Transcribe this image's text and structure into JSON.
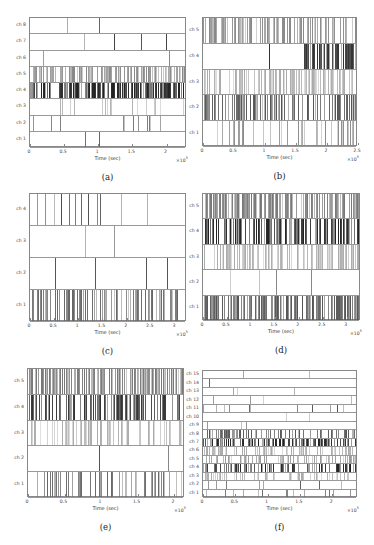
{
  "figure": {
    "xlabel": "Time (sec)",
    "multiplier": "×10",
    "exponent": "5"
  },
  "chart_data": [
    {
      "id": "a",
      "caption": "(a)",
      "type": "raster",
      "xlabel": "Time (sec)",
      "x_multiplier": "x10^5",
      "xlim": [
        0,
        2.3
      ],
      "xticks": [
        "0",
        "0.5",
        "1",
        "1.5",
        "2"
      ],
      "xtick_values": [
        0,
        0.5,
        1,
        1.5,
        2
      ],
      "channels": [
        "ch 1",
        "ch 2",
        "ch 3",
        "ch 4",
        "ch 5",
        "ch 6",
        "ch 7",
        "ch 8"
      ],
      "box": {
        "left": 29,
        "top": 17,
        "width": 157,
        "height": 130
      },
      "density": [
        1,
        12,
        18,
        160,
        130,
        1,
        2,
        1
      ],
      "shade": [
        "#666",
        "#777",
        "#aaa",
        "#222",
        "#888",
        "#888",
        "#444",
        "#666"
      ],
      "spikes_fixed": {
        "ch 8": [
          1.03
        ],
        "ch 7": [
          1.24,
          2.02
        ],
        "ch 1": [
          1.03
        ],
        "ch 6": [
          2.06
        ]
      },
      "seed": 11
    },
    {
      "id": "b",
      "caption": "(b)",
      "type": "raster",
      "xlabel": "Time (sec)",
      "x_multiplier": "x10^5",
      "xlim": [
        0,
        2.5
      ],
      "xticks": [
        "0",
        "0.5",
        "1",
        "1.5",
        "2",
        "2.5"
      ],
      "xtick_values": [
        0,
        0.5,
        1,
        1.5,
        2,
        2.5
      ],
      "channels": [
        "ch 1",
        "ch 2",
        "ch 3",
        "ch 4",
        "ch 5"
      ],
      "box": {
        "left": 202,
        "top": 17,
        "width": 155,
        "height": 129
      },
      "density": [
        40,
        110,
        120,
        70,
        110
      ],
      "shade": [
        "#888",
        "#555",
        "#aaa",
        "#333",
        "#888"
      ],
      "ch4_start": 1.65,
      "spikes_fixed": {
        "ch 4": [
          1.08
        ]
      },
      "seed": 23
    },
    {
      "id": "c",
      "caption": "(c)",
      "type": "raster",
      "xlabel": "Time (sec)",
      "x_multiplier": "x10^5",
      "xlim": [
        0,
        3.25
      ],
      "xticks": [
        "0",
        "0.5",
        "1",
        "1.5",
        "2",
        "2.5",
        "3"
      ],
      "xtick_values": [
        0,
        0.5,
        1,
        1.5,
        2,
        2.5,
        3
      ],
      "channels": [
        "ch 1",
        "ch 2",
        "ch 3",
        "ch 4"
      ],
      "box": {
        "left": 29,
        "top": 193,
        "width": 157,
        "height": 128
      },
      "density": [
        90,
        2,
        1,
        12
      ],
      "shade": [
        "#666",
        "#555",
        "#999",
        "#444"
      ],
      "spikes_fixed": {
        "ch 3": [
          1.77
        ],
        "ch 2": [
          2.44,
          2.87
        ]
      },
      "seed": 37
    },
    {
      "id": "d",
      "caption": "(d)",
      "type": "raster",
      "xlabel": "Time (sec)",
      "x_multiplier": "x10^5",
      "xlim": [
        0,
        3.3
      ],
      "xticks": [
        "0",
        "0.5",
        "1",
        "1.5",
        "2",
        "2.5",
        "3"
      ],
      "xtick_values": [
        0,
        0.5,
        1,
        1.5,
        2,
        2.5,
        3
      ],
      "channels": [
        "ch 1",
        "ch 2",
        "ch 3",
        "ch 4",
        "ch 5"
      ],
      "box": {
        "left": 202,
        "top": 193,
        "width": 158,
        "height": 127
      },
      "density": [
        150,
        2,
        110,
        120,
        150
      ],
      "shade": [
        "#555",
        "#888",
        "#aaa",
        "#222",
        "#777"
      ],
      "spikes_fixed": {
        "ch 2": [
          1.55,
          2.28
        ]
      },
      "seed": 41
    },
    {
      "id": "e",
      "caption": "(e)",
      "type": "raster",
      "xlabel": "Time (sec)",
      "x_multiplier": "x10^5",
      "xlim": [
        0,
        2.15
      ],
      "xticks": [
        "0",
        "0.5",
        "1",
        "1.5",
        "2"
      ],
      "xtick_values": [
        0,
        0.5,
        1,
        1.5,
        2
      ],
      "channels": [
        "ch 1",
        "ch 2",
        "ch 3",
        "ch 4",
        "ch 5"
      ],
      "box": {
        "left": 27,
        "top": 368,
        "width": 157,
        "height": 129
      },
      "density": [
        60,
        1,
        70,
        110,
        170
      ],
      "shade": [
        "#666",
        "#555",
        "#aaa",
        "#333",
        "#777"
      ],
      "spikes_fixed": {
        "ch 2": [
          0.99
        ]
      },
      "seed": 53
    },
    {
      "id": "f",
      "caption": "(f)",
      "type": "raster",
      "xlabel": "Time (sec)",
      "x_multiplier": "x10^5",
      "xlim": [
        0,
        2.4
      ],
      "xticks": [
        "0",
        "0.5",
        "1",
        "1.5",
        "2"
      ],
      "xtick_values": [
        0,
        0.5,
        1,
        1.5,
        2
      ],
      "channels": [
        "ch 1",
        "ch 2",
        "ch 3",
        "ch 4",
        "ch 5",
        "ch 6",
        "ch 7",
        "ch 8",
        "ch 9",
        "ch 10",
        "ch 11",
        "ch 12",
        "ch 13",
        "ch 14",
        "ch 15"
      ],
      "box": {
        "left": 202,
        "top": 370,
        "width": 155,
        "height": 127
      },
      "density": [
        14,
        8,
        60,
        90,
        70,
        80,
        130,
        80,
        3,
        2,
        12,
        4,
        3,
        1,
        2
      ],
      "shade": [
        "#666",
        "#555",
        "#aaa",
        "#222",
        "#999",
        "#aaa",
        "#222",
        "#555",
        "#888",
        "#888",
        "#444",
        "#888",
        "#888",
        "#444",
        "#666"
      ],
      "seed": 67
    }
  ]
}
